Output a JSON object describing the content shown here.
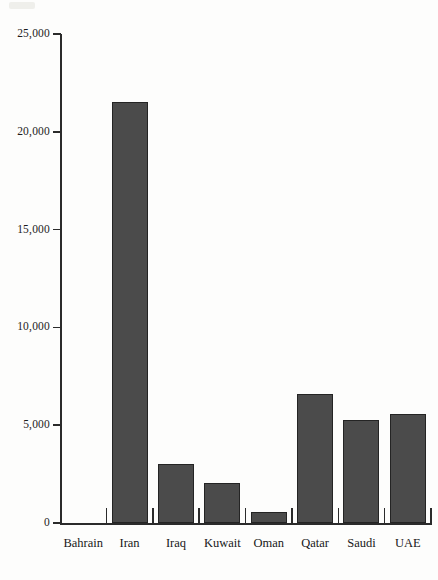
{
  "chart_data": {
    "type": "bar",
    "title": "",
    "xlabel": "",
    "ylabel": "",
    "categories": [
      "Bahrain",
      "Iran",
      "Iraq",
      "Kuwait",
      "Oman",
      "Qatar",
      "Saudi",
      "UAE"
    ],
    "values": [
      0,
      21500,
      3000,
      2050,
      560,
      6600,
      5250,
      5580
    ],
    "ylim": [
      0,
      25000
    ],
    "yticks": [
      0,
      5000,
      10000,
      15000,
      20000,
      25000
    ],
    "ytick_labels": [
      "0",
      "5,000",
      "10,000",
      "15,000",
      "20,000",
      "25,000"
    ],
    "grid": false,
    "legend": null,
    "bar_color": "#4b4b4b",
    "bar_border_color": "#242424",
    "axis_color": "#2b2b2b"
  }
}
